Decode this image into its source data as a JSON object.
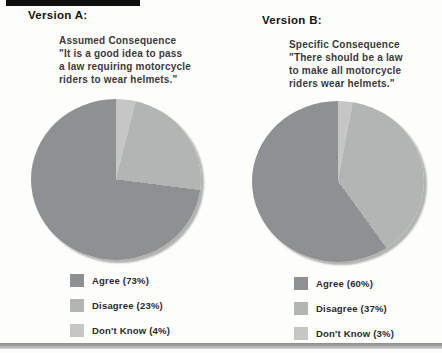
{
  "panels": [
    {
      "heading": "Version A:",
      "description_lines": [
        "Assumed Consequence",
        "\"It is a good idea to pass",
        "a law requiring motorcycle",
        "riders to wear helmets.\""
      ],
      "legend": [
        "Agree (73%)",
        "Disagree (23%)",
        "Don't Know (4%)"
      ]
    },
    {
      "heading": "Version B:",
      "description_lines": [
        "Specific Consequence",
        "\"There should be a law",
        "to make all motorcycle",
        "riders wear helmets.\""
      ],
      "legend": [
        "Agree (60%)",
        "Disagree (37%)",
        "Don't Know (3%)"
      ]
    }
  ],
  "chart_data": [
    {
      "type": "pie",
      "title": "Version A: Assumed Consequence",
      "labels": [
        "Agree",
        "Disagree",
        "Don't Know"
      ],
      "values": [
        73,
        23,
        4
      ],
      "colors": [
        "#8f9091",
        "#b3b4b4",
        "#c5c6c5"
      ],
      "draw_order": [
        2,
        1,
        0
      ],
      "start_angle_deg": 0,
      "direction": "clockwise",
      "legend_position": "bottom"
    },
    {
      "type": "pie",
      "title": "Version B: Specific Consequence",
      "labels": [
        "Agree",
        "Disagree",
        "Don't Know"
      ],
      "values": [
        60,
        37,
        3
      ],
      "colors": [
        "#8f9091",
        "#b3b4b4",
        "#c5c6c5"
      ],
      "draw_order": [
        2,
        1,
        0
      ],
      "start_angle_deg": 0,
      "direction": "clockwise",
      "legend_position": "bottom"
    }
  ],
  "colors": {
    "agree": "#8f9091",
    "disagree": "#b3b4b4",
    "dont_know": "#c5c6c5",
    "top_bar": "#0e0e0e"
  }
}
